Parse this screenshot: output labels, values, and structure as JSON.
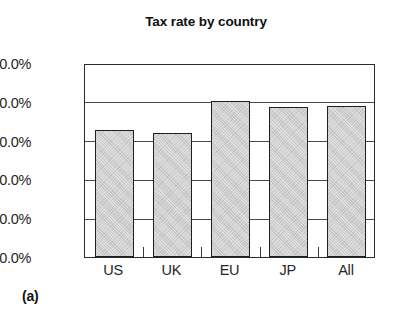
{
  "caption": "(a)",
  "chart_data": {
    "type": "bar",
    "title": "Tax rate by country",
    "xlabel": "",
    "ylabel": "",
    "categories": [
      "US",
      "UK",
      "EU",
      "JP",
      "All"
    ],
    "values": [
      32.8,
      31.9,
      40.1,
      38.6,
      39.0
    ],
    "value_labels": [
      "32.8%",
      "31.9%",
      "40.1%",
      "38.6%",
      "39.0%"
    ],
    "ylim": [
      0,
      50
    ],
    "ytick_values": [
      50,
      40,
      30,
      20,
      10,
      0
    ],
    "ytick_labels": [
      "50.0%",
      "40.0%",
      "30.0%",
      "20.0%",
      "10.0%",
      "0.0%"
    ],
    "gridlines": [
      40,
      30,
      20,
      10
    ],
    "grid": true,
    "legend": null,
    "legend_position": "none",
    "bar_fill_color": "#c9c9c9",
    "bar_edge_color": "#1f1f1f",
    "axis_color": "#2b2b2b",
    "background_color": "#ffffff"
  }
}
